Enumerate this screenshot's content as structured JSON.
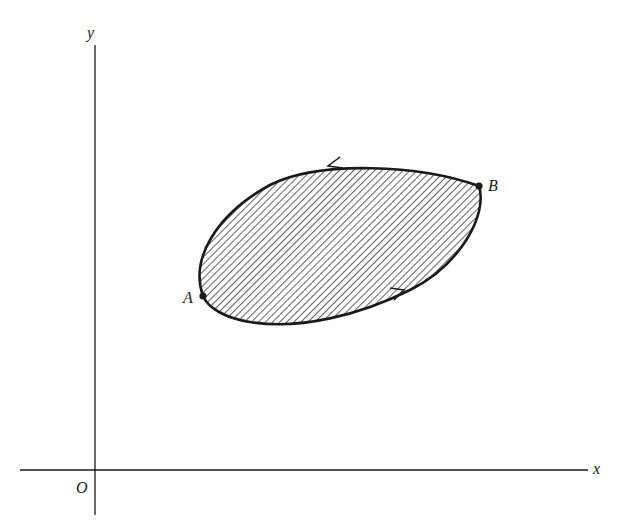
{
  "figure": {
    "axes": {
      "x_label": "x",
      "y_label": "y",
      "origin_label": "O"
    },
    "points": [
      {
        "id": "A",
        "label": "A"
      },
      {
        "id": "B",
        "label": "B"
      }
    ],
    "arcs": [
      {
        "name": "lower-arc",
        "from": "A",
        "to": "B",
        "arrow_direction": "right"
      },
      {
        "name": "upper-arc",
        "from": "B",
        "to": "A",
        "arrow_direction": "left"
      }
    ],
    "region": {
      "fill": "diagonal-hatching"
    },
    "colors": {
      "ink": "#1a1a1a",
      "hatch": "#3a3a3a",
      "background": "#ffffff"
    }
  }
}
